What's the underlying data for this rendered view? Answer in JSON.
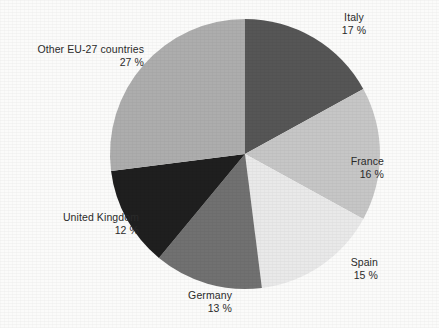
{
  "chart_data": {
    "type": "pie",
    "title": "",
    "subtitle": "",
    "xlabel": "",
    "ylabel": "",
    "legend_position": "none",
    "grid": false,
    "label_format": "{name} {value} %",
    "start_angle_deg": 0,
    "direction": "clockwise",
    "unit": "%",
    "categories": [
      "Italy",
      "France",
      "Spain",
      "Germany",
      "United Kingdom",
      "Other EU-27 countries"
    ],
    "values": [
      17,
      16,
      15,
      13,
      12,
      27
    ],
    "slices": [
      {
        "name": "Italy",
        "value": 17,
        "value_text": "17 %",
        "color": "#565656",
        "label_align": "center"
      },
      {
        "name": "France",
        "value": 16,
        "value_text": "16 %",
        "color": "#c6c6c6",
        "label_align": "right"
      },
      {
        "name": "Spain",
        "value": 15,
        "value_text": "15 %",
        "color": "#e9e9e9",
        "label_align": "right"
      },
      {
        "name": "Germany",
        "value": 13,
        "value_text": "13 %",
        "color": "#717171",
        "label_align": "right"
      },
      {
        "name": "United Kingdom",
        "value": 12,
        "value_text": "12 %",
        "color": "#1f1f1f",
        "label_align": "right"
      },
      {
        "name": "Other EU-27 countries",
        "value": 27,
        "value_text": "27 %",
        "color": "#adadad",
        "label_align": "right"
      }
    ],
    "background_color": "#fbfbfa",
    "label_color": "#2b2b2b"
  }
}
